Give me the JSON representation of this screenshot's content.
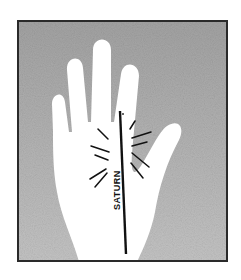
{
  "illustration": {
    "subject": "palm-hand-with-line",
    "line_label": "SATURN",
    "colors": {
      "background": "#ffffff",
      "frame_border": "#2a2a2a",
      "stipple_fill": "#9c9c9c",
      "hand_fill": "#ffffff",
      "line_ink": "#111111"
    }
  }
}
